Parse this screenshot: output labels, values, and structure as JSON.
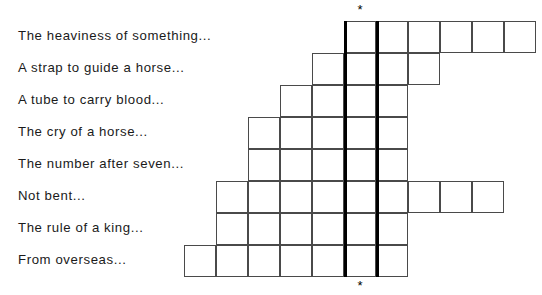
{
  "worksheet": {
    "title": "Crossword-style clue worksheet",
    "clue_column_x": 18,
    "clues": [
      {
        "id": "clue-1",
        "text": "The heaviness of something...",
        "y": 29
      },
      {
        "id": "clue-2",
        "text": "A strap to guide a horse...",
        "y": 61
      },
      {
        "id": "clue-3",
        "text": "A tube to carry blood...",
        "y": 93
      },
      {
        "id": "clue-4",
        "text": "The cry of a horse...",
        "y": 125
      },
      {
        "id": "clue-5",
        "text": "The number after seven...",
        "y": 157
      },
      {
        "id": "clue-6",
        "text": "Not bent...",
        "y": 189
      },
      {
        "id": "clue-7",
        "text": "The rule of a king...",
        "y": 221
      },
      {
        "id": "clue-8",
        "text": "From overseas...",
        "y": 253
      }
    ]
  },
  "grid": {
    "cell_size": 32,
    "origin_x": 184,
    "origin_y": 21,
    "rows": 8,
    "border_color": "#4a4a4a",
    "highlight_color": "#000000",
    "row_spans": [
      {
        "row": 1,
        "clue": "The heaviness of something...",
        "start_col": 5,
        "cells": 6
      },
      {
        "row": 2,
        "clue": "A strap to guide a horse...",
        "start_col": 4,
        "cells": 4
      },
      {
        "row": 3,
        "clue": "A tube to carry blood...",
        "start_col": 3,
        "cells": 4
      },
      {
        "row": 4,
        "clue": "The cry of a horse...",
        "start_col": 2,
        "cells": 5
      },
      {
        "row": 5,
        "clue": "The number after seven...",
        "start_col": 2,
        "cells": 5
      },
      {
        "row": 6,
        "clue": "Not bent...",
        "start_col": 1,
        "cells": 9
      },
      {
        "row": 7,
        "clue": "The rule of a king...",
        "start_col": 1,
        "cells": 6
      },
      {
        "row": 8,
        "clue": "From overseas...",
        "start_col": 0,
        "cells": 7
      }
    ],
    "highlight_columns": [
      {
        "name": "left-bold-rule",
        "x": 344,
        "y": 21,
        "height": 256
      },
      {
        "name": "right-bold-rule",
        "x": 376,
        "y": 21,
        "height": 256
      }
    ],
    "markers": [
      {
        "name": "top-asterisk",
        "glyph": "*",
        "x": 350,
        "y": 3
      },
      {
        "name": "bottom-asterisk",
        "glyph": "*",
        "x": 350,
        "y": 279
      }
    ]
  }
}
